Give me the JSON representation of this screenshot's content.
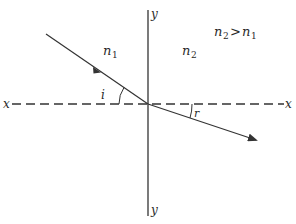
{
  "diagram": {
    "axes": {
      "x_label_left": "x",
      "x_label_right": "x",
      "y_label_top": "y",
      "y_label_bottom": "y"
    },
    "media": {
      "n1": {
        "symbol": "n",
        "subscript": "1"
      },
      "n2": {
        "symbol": "n",
        "subscript": "2"
      }
    },
    "condition": {
      "left_symbol": "n",
      "left_subscript": "2",
      "operator": ">",
      "right_symbol": "n",
      "right_subscript": "1"
    },
    "angles": {
      "incidence": "i",
      "refraction": "r"
    },
    "colors": {
      "line": "#333333",
      "background": "#ffffff"
    }
  }
}
